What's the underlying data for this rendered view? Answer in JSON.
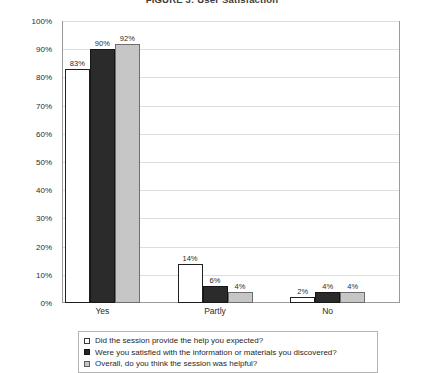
{
  "chart_data": {
    "type": "bar",
    "title": "FIGURE 3: User Satisfaction",
    "xlabel": "",
    "ylabel": "",
    "ylim": [
      0,
      100
    ],
    "grid": true,
    "legend_position": "bottom",
    "categories": [
      "Yes",
      "Partly",
      "No"
    ],
    "ytick_labels": [
      "0%",
      "10%",
      "20%",
      "30%",
      "40%",
      "50%",
      "60%",
      "70%",
      "80%",
      "90%",
      "100%"
    ],
    "ytick_values": [
      0,
      10,
      20,
      30,
      40,
      50,
      60,
      70,
      80,
      90,
      100
    ],
    "series": [
      {
        "name": "Did the session provide the help you expected?",
        "color": "#ffffff",
        "values": [
          83,
          14,
          2
        ],
        "data_labels": [
          "83%",
          "14%",
          "2%"
        ]
      },
      {
        "name": "Were you satisfied with the information or materials you discovered?",
        "color": "#2b2b2b",
        "values": [
          90,
          6,
          4
        ],
        "data_labels": [
          "90%",
          "6%",
          "4%"
        ]
      },
      {
        "name": "Overall, do you think the session was helpful?",
        "color": "#c6c6c6",
        "values": [
          92,
          4,
          4
        ],
        "data_labels": [
          "92%",
          "4%",
          "4%"
        ]
      }
    ]
  }
}
